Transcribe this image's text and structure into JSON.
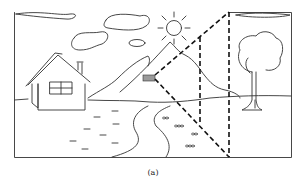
{
  "figure": {
    "caption": "(a)",
    "elements": [
      "frame",
      "clouds",
      "sun",
      "mountains",
      "house",
      "river",
      "stepping-stones",
      "tree",
      "camera",
      "frustum-lines"
    ],
    "colors": {
      "stroke": "#333333",
      "camera_fill": "#9a9a9a",
      "background": "#ffffff"
    }
  }
}
